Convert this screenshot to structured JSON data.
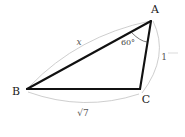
{
  "figure": {
    "type": "triangle-geometry-diagram",
    "background_color": "#ffffff",
    "edge_color": "#111111",
    "arc_color": "#b9b9b9",
    "vertices": {
      "a_label": "A",
      "b_label": "B",
      "c_label": "C"
    },
    "angles": {
      "at_a_label": "60°",
      "at_a_value": 60
    },
    "sides": {
      "ab_label": "x",
      "ac_label": "1",
      "bc_label": "√7"
    }
  }
}
